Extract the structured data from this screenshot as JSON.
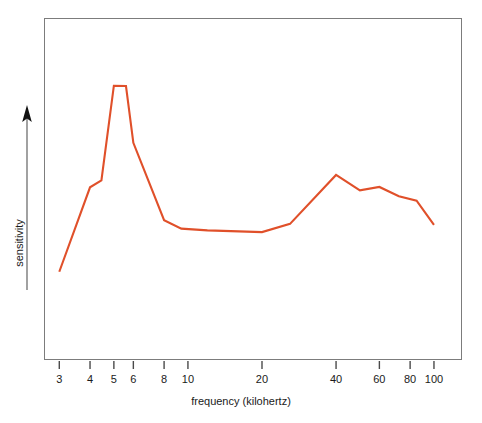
{
  "chart_data": {
    "type": "line",
    "title": "",
    "subtitle": "",
    "xlabel": "frequency (kilohertz)",
    "ylabel": "sensitivity",
    "xscale": "log",
    "yscale": "linear",
    "grid": false,
    "legend": null,
    "xlim": [
      2.6,
      130
    ],
    "ylim": [
      0,
      1
    ],
    "xticks": [
      3,
      4,
      5,
      6,
      8,
      10,
      20,
      40,
      60,
      80,
      100
    ],
    "xtick_labels": [
      "3",
      "4",
      "5",
      "6",
      "8",
      "10",
      "20",
      "40",
      "60",
      "80",
      "100"
    ],
    "yticks": [],
    "ytick_labels": [],
    "series": [
      {
        "name": "sensitivity",
        "color": "#e0502a",
        "x": [
          3.0,
          4.0,
          4.45,
          5.0,
          5.6,
          6.0,
          8.0,
          9.4,
          12.0,
          20.0,
          26.0,
          40.0,
          50.0,
          60.0,
          72.0,
          85.0,
          100.0
        ],
        "y": [
          0.258,
          0.505,
          0.525,
          0.802,
          0.801,
          0.635,
          0.409,
          0.384,
          0.379,
          0.374,
          0.398,
          0.541,
          0.496,
          0.506,
          0.479,
          0.466,
          0.395
        ]
      }
    ],
    "annotations": []
  },
  "axis": {
    "x_title": "frequency (kilohertz)",
    "y_title": "sensitivity",
    "y_arrow": "up-arrow"
  }
}
